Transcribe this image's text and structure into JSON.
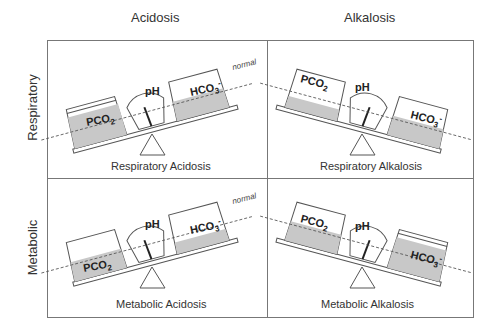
{
  "columns": [
    {
      "label": "Acidosis"
    },
    {
      "label": "Alkalosis"
    }
  ],
  "rows": [
    {
      "label": "Respiratory"
    },
    {
      "label": "Metabolic"
    }
  ],
  "panels": [
    {
      "caption": "Respiratory Acidosis",
      "tilt": "left-down",
      "normal_label": "normal",
      "left": "PCO2",
      "right": "HCO3-",
      "fill_left": "high",
      "fill_right": "normal"
    },
    {
      "caption": "Respiratory Alkalosis",
      "tilt": "right-down",
      "left": "PCO2",
      "right": "HCO3-",
      "fill_left": "low",
      "fill_right": "normal"
    },
    {
      "caption": "Metabolic Acidosis",
      "tilt": "left-down",
      "normal_label": "normal",
      "left": "PCO2",
      "right": "HCO3-",
      "fill_left": "normal",
      "fill_right": "low"
    },
    {
      "caption": "Metabolic Alkalosis",
      "tilt": "right-down",
      "left": "PCO2",
      "right": "HCO3-",
      "fill_left": "normal",
      "fill_right": "high"
    }
  ],
  "labels": {
    "ph": "pH",
    "low": "L",
    "high": "H",
    "pco2": "PCO",
    "pco2_sub": "2",
    "hco3": "HCO",
    "hco3_sub": "3",
    "hco3_sup": "-",
    "normal": "normal"
  },
  "colors": {
    "fill": "#c8c8c8",
    "line": "#555555",
    "border": "#777777"
  }
}
